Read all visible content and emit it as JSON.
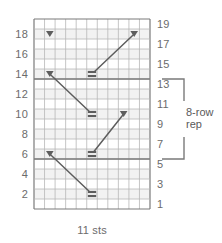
{
  "chart_data": {
    "type": "table",
    "xlabel": "11 sts",
    "ylabel": "",
    "stitches_wide": 11,
    "rows_tall": 19,
    "grid": true,
    "left_axis_labels": [
      "18",
      "16",
      "14",
      "12",
      "10",
      "8",
      "6",
      "4",
      "2"
    ],
    "right_axis_labels": [
      "19",
      "17",
      "15",
      "13",
      "11",
      "9",
      "7",
      "5",
      "3",
      "1"
    ],
    "left_axis_rows": [
      18,
      16,
      14,
      12,
      10,
      8,
      6,
      4,
      2
    ],
    "right_axis_rows": [
      19,
      17,
      15,
      13,
      11,
      9,
      7,
      5,
      3,
      1
    ],
    "symbols": [
      {
        "name": "triangle-down",
        "row": 18,
        "col": 2
      },
      {
        "name": "triangle-down",
        "row": 14,
        "col": 2
      },
      {
        "name": "triangle-down",
        "row": 6,
        "col": 2
      },
      {
        "name": "triangle-down",
        "row": 10,
        "col": 9
      },
      {
        "name": "triangle-down",
        "row": 18,
        "col": 10
      },
      {
        "name": "purl-bar",
        "row": 14,
        "col": 6
      },
      {
        "name": "purl-bar",
        "row": 10,
        "col": 6
      },
      {
        "name": "purl-bar",
        "row": 6,
        "col": 6
      },
      {
        "name": "purl-bar",
        "row": 2,
        "col": 6
      }
    ],
    "cable_lines": [
      {
        "name": "cable-line-up",
        "from_row": 14,
        "from_col": 6,
        "to_row": 18,
        "to_col": 10
      },
      {
        "name": "cable-line-down",
        "from_row": 14,
        "from_col": 2,
        "to_row": 10,
        "to_col": 6
      },
      {
        "name": "cable-line-up",
        "from_row": 6,
        "from_col": 6,
        "to_row": 10,
        "to_col": 9
      },
      {
        "name": "cable-line-down",
        "from_row": 6,
        "from_col": 2,
        "to_row": 2,
        "to_col": 6
      }
    ],
    "repeat": {
      "label_line1": "8-row",
      "label_line2": "rep",
      "full_label": "8-row rep",
      "rows": 8,
      "start_row": 6,
      "end_row": 13
    },
    "colors": {
      "grid_line": "#7a7a7a",
      "grid_line_light": "#b8b8b8",
      "symbol": "#5d5d5d",
      "text": "#6b6b6b",
      "background": "#ffffff",
      "row_shade": "#f2f2f2"
    }
  },
  "bottom": {
    "sts_label": "11 sts"
  }
}
